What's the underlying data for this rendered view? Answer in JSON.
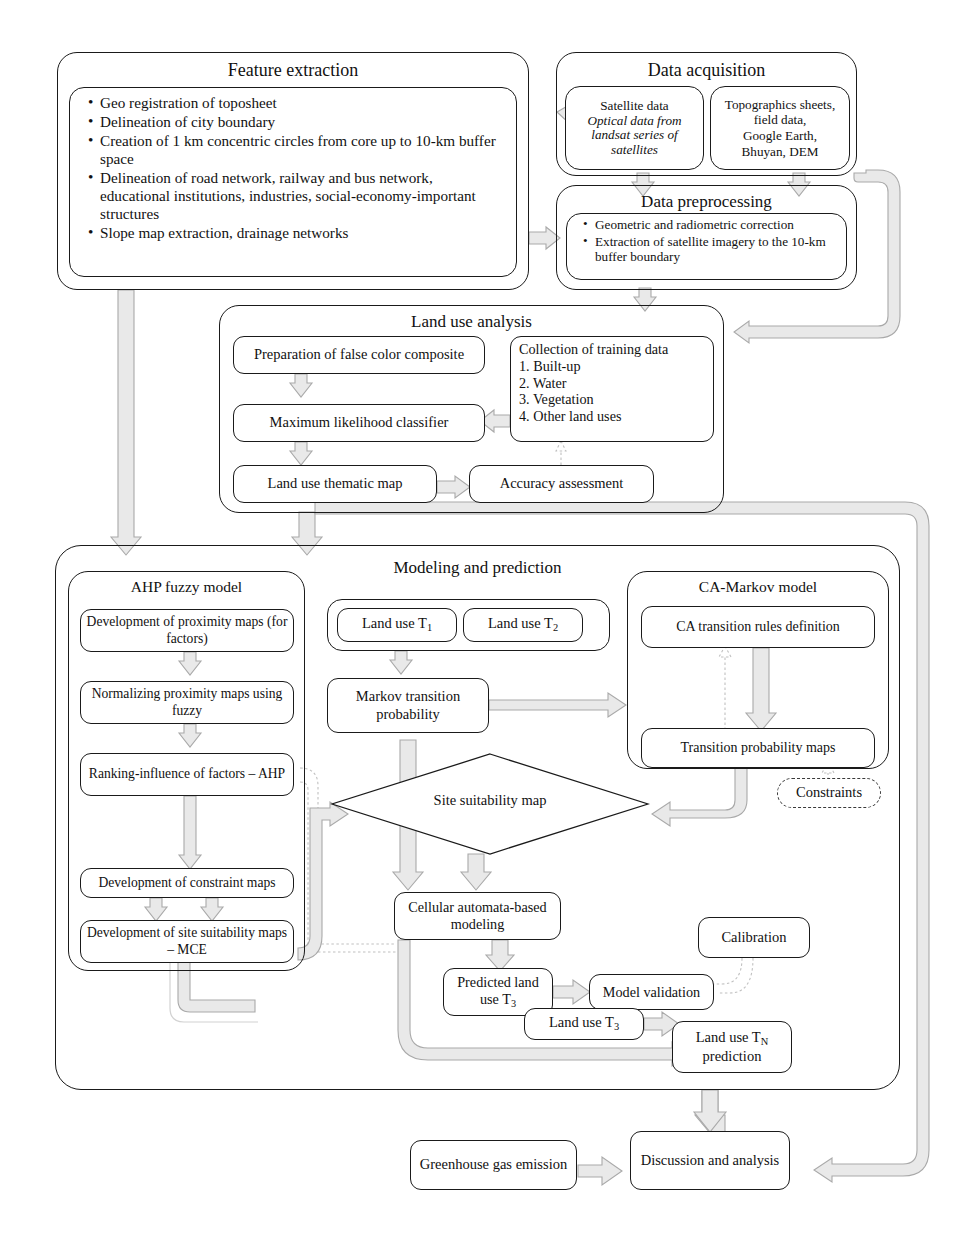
{
  "feature_extraction": {
    "title": "Feature extraction",
    "bullets": [
      "Geo registration of toposheet",
      "Delineation of city boundary",
      "Creation of 1 km concentric circles from core up to 10-km buffer space",
      "Delineation of road network, railway and bus network, educational institutions, industries, social-economy-important structures",
      "Slope map extraction, drainage networks"
    ]
  },
  "data_acquisition": {
    "title": "Data acquisition",
    "satellite": {
      "line1": "Satellite data",
      "line2": "Optical data from landsat series of satellites"
    },
    "ancillary": {
      "line1": "Topographics sheets,",
      "line2": "field data,",
      "line3": "Google Earth,",
      "line4": "Bhuyan, DEM"
    }
  },
  "data_preprocessing": {
    "title": "Data preprocessing",
    "bullets": [
      "Geometric and radiometric correction",
      "Extraction of satellite imagery to the 10-km buffer boundary"
    ]
  },
  "land_use_analysis": {
    "title": "Land use analysis",
    "fcc": "Preparation of false color composite",
    "classifier": "Maximum likelihood classifier",
    "thematic_map": "Land use thematic map",
    "accuracy": "Accuracy assessment",
    "training": {
      "header": "Collection of training data",
      "items": [
        "1. Built-up",
        "2. Water",
        "3. Vegetation",
        "4. Other land uses"
      ]
    }
  },
  "modeling": {
    "title": "Modeling and prediction",
    "ahp": {
      "title": "AHP fuzzy model",
      "steps": [
        "Development of proximity maps (for factors)",
        "Normalizing proximity maps using fuzzy",
        "Ranking-influence of factors – AHP",
        "Development of constraint maps",
        "Development of site suitability maps – MCE"
      ]
    },
    "camarkov": {
      "title": "CA-Markov model",
      "rules": "CA transition rules definition",
      "probability_maps": "Transition probability maps"
    },
    "land_use_t1": "Land use T",
    "land_use_t1_sub": "1",
    "land_use_t2": "Land use T",
    "land_use_t2_sub": "2",
    "markov": "Markov transition probability",
    "site_suitability": "Site suitability map",
    "constraints": "Constraints",
    "ca_modeling": "Cellular automata-based modeling",
    "predicted": "Predicted land use T",
    "predicted_sub": "3",
    "validation": "Model validation",
    "calibration": "Calibration",
    "land_use_t3": "Land use T",
    "land_use_t3_sub": "3",
    "prediction": "Land use T",
    "prediction_sub": "N",
    "prediction_line2": "prediction"
  },
  "outputs": {
    "greenhouse": "Greenhouse gas emission",
    "discussion": "Discussion and analysis"
  },
  "colors": {
    "stroke": "#1a1a1a",
    "arrow_fill": "#e8e8e8",
    "arrow_stroke": "#a8a8a8",
    "dotted": "#b9b9b9",
    "background": "#ffffff"
  }
}
